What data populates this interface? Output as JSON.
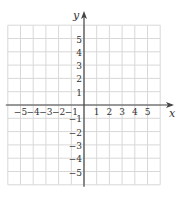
{
  "chart_data": {
    "type": "coordinate-grid",
    "xlabel": "x",
    "ylabel": "y",
    "xlim": [
      -6,
      6
    ],
    "ylim": [
      -6,
      6
    ],
    "grid": true,
    "x_ticks": [
      "-5",
      "-4",
      "-3",
      "-2",
      "-1",
      "1",
      "2",
      "3",
      "4",
      "5"
    ],
    "y_ticks": [
      "5",
      "4",
      "3",
      "2",
      "1",
      "-1",
      "-2",
      "-3",
      "-4",
      "-5"
    ]
  },
  "colors": {
    "grid": "#d8d8d8",
    "axis": "#444444"
  }
}
